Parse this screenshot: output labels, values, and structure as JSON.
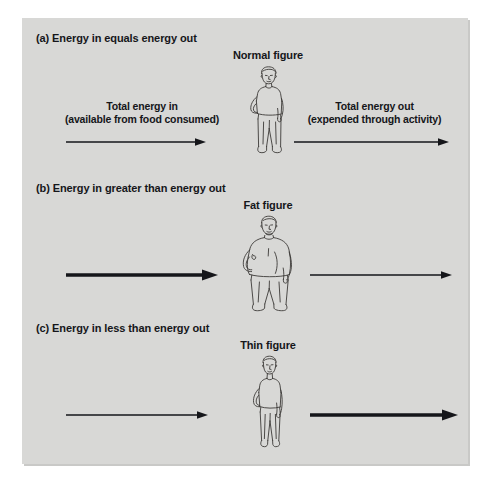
{
  "figure": {
    "background_color": "#d8d8d6",
    "ink_color": "#15161a",
    "sections": [
      {
        "id": "a",
        "heading": "(a) Energy in equals energy out",
        "figure_label": "Normal figure",
        "figure_type": "normal",
        "left": {
          "caption_line1": "Total energy in",
          "caption_line2": "(available from food consumed)",
          "arrow": "thin"
        },
        "right": {
          "caption_line1": "Total energy out",
          "caption_line2": "(expended through activity)",
          "arrow": "thin"
        }
      },
      {
        "id": "b",
        "heading": "(b) Energy in greater than energy out",
        "figure_label": "Fat figure",
        "figure_type": "fat",
        "left": {
          "caption_line1": "",
          "caption_line2": "",
          "arrow": "thick"
        },
        "right": {
          "caption_line1": "",
          "caption_line2": "",
          "arrow": "thin"
        }
      },
      {
        "id": "c",
        "heading": "(c) Energy in less than energy out",
        "figure_label": "Thin figure",
        "figure_type": "thin",
        "left": {
          "caption_line1": "",
          "caption_line2": "",
          "arrow": "thin"
        },
        "right": {
          "caption_line1": "",
          "caption_line2": "",
          "arrow": "thick"
        }
      }
    ]
  }
}
